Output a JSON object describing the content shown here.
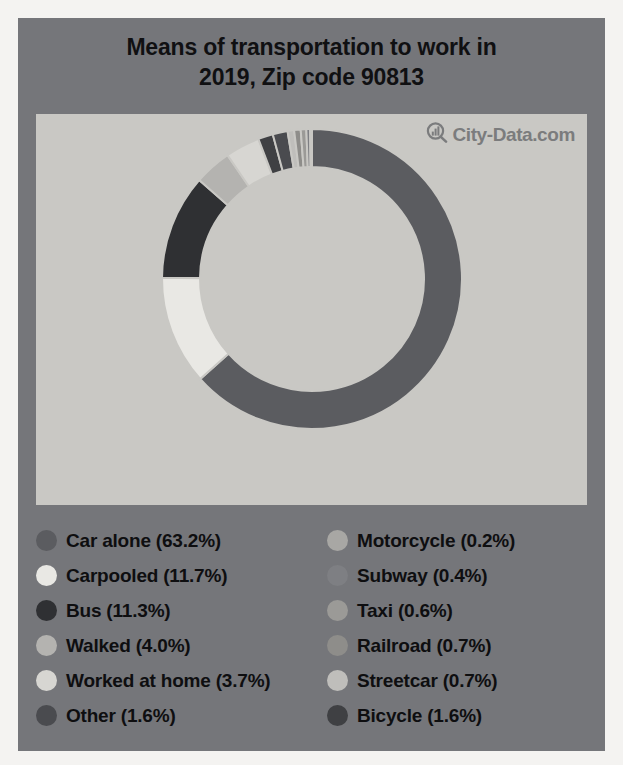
{
  "card": {
    "background_color": "#75767a",
    "panel_color": "#c9c8c4"
  },
  "title": {
    "line1": "Means of transportation to work in",
    "line2": "2019, Zip code 90813"
  },
  "watermark": {
    "text": "City-Data.com",
    "icon": "magnifier-bar-chart-icon"
  },
  "chart_data": {
    "type": "pie",
    "variant": "donut",
    "title": "Means of transportation to work in 2019, Zip code 90813",
    "subtitle": "",
    "xlabel": "",
    "ylabel": "",
    "unit": "percent",
    "start_angle_deg": 0,
    "direction": "clockwise",
    "outer_radius_px": 150,
    "inner_radius_px": 112,
    "center": [
      315,
      315
    ],
    "legend_position": "bottom",
    "grid": false,
    "labels": [
      "Car alone",
      "Carpooled",
      "Bus",
      "Walked",
      "Worked at home",
      "Other",
      "Motorcycle",
      "Subway",
      "Taxi",
      "Railroad",
      "Streetcar",
      "Bicycle"
    ],
    "values": [
      63.2,
      11.7,
      11.3,
      4.0,
      3.7,
      1.6,
      0.2,
      0.4,
      0.6,
      0.7,
      0.7,
      1.6
    ],
    "colors": [
      "#5b5c60",
      "#e9e8e4",
      "#2f3033",
      "#b4b3b0",
      "#d7d6d2",
      "#4a4b4f",
      "#a8a7a4",
      "#7e7f83",
      "#9b9a97",
      "#8e8d8a",
      "#bfbebb",
      "#3f4043"
    ],
    "slice_order": [
      "Car alone",
      "Carpooled",
      "Bus",
      "Walked",
      "Worked at home",
      "Bicycle",
      "Other",
      "Streetcar",
      "Railroad",
      "Taxi",
      "Subway",
      "Motorcycle"
    ],
    "slice_separator_color": "#c9c8c4"
  },
  "legend": {
    "left": [
      {
        "label": "Car alone (63.2%)",
        "color": "#5b5c60",
        "name": "car-alone"
      },
      {
        "label": "Carpooled (11.7%)",
        "color": "#e9e8e4",
        "name": "carpooled"
      },
      {
        "label": "Bus (11.3%)",
        "color": "#2f3033",
        "name": "bus"
      },
      {
        "label": "Walked (4.0%)",
        "color": "#b4b3b0",
        "name": "walked"
      },
      {
        "label": "Worked at home (3.7%)",
        "color": "#d7d6d2",
        "name": "worked-at-home"
      },
      {
        "label": "Other (1.6%)",
        "color": "#4a4b4f",
        "name": "other"
      }
    ],
    "right": [
      {
        "label": "Motorcycle (0.2%)",
        "color": "#a8a7a4",
        "name": "motorcycle"
      },
      {
        "label": "Subway (0.4%)",
        "color": "#7e7f83",
        "name": "subway"
      },
      {
        "label": "Taxi (0.6%)",
        "color": "#9b9a97",
        "name": "taxi"
      },
      {
        "label": "Railroad (0.7%)",
        "color": "#8e8d8a",
        "name": "railroad"
      },
      {
        "label": "Streetcar (0.7%)",
        "color": "#bfbebb",
        "name": "streetcar"
      },
      {
        "label": "Bicycle (1.6%)",
        "color": "#3f4043",
        "name": "bicycle"
      }
    ]
  }
}
